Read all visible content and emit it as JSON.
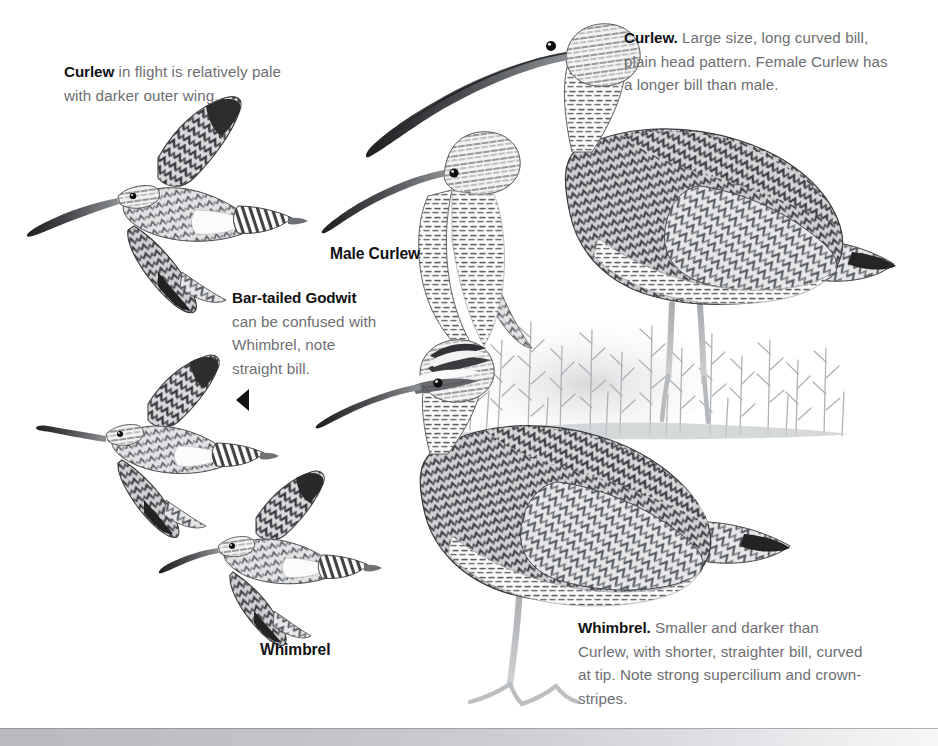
{
  "page": {
    "kind": "field-guide-plate",
    "background_color": "#ffffff",
    "width": 938,
    "height": 746,
    "medium": "graphite pencil illustration",
    "palette": {
      "body_text": "#6e6e72",
      "heading_text": "#111114",
      "artwork_ink": "#3a3a3d",
      "artwork_light": "#b6b8bb",
      "vegetation": "#b9bcbf",
      "footer_bar": "#c3c5c8"
    }
  },
  "callouts": {
    "curlew_flight": {
      "lead": "Curlew",
      "body": " in flight is relatively pale with darker outer wing."
    },
    "curlew_main": {
      "lead": "Curlew.",
      "body": " Large size, long curved bill, plain head pattern. Female Curlew has a longer bill than male."
    },
    "godwit": {
      "lead": "Bar-tailed Godwit",
      "body": " can be confused with Whimbrel, note straight bill."
    },
    "whimbrel_main": {
      "lead": "Whimbrel.",
      "body": " Smaller and darker than Curlew, with shorter, straighter bill, curved at tip. Note strong supercilium and crown-stripes."
    }
  },
  "labels": {
    "male_curlew": "Male Curlew",
    "whimbrel": "Whimbrel"
  },
  "figures": [
    {
      "name": "curlew-in-flight",
      "species": "Curlew",
      "pose": "flight",
      "position": "upper-left"
    },
    {
      "name": "bar-tailed-godwit-in-flight",
      "species": "Bar-tailed Godwit",
      "pose": "flight",
      "position": "mid-left"
    },
    {
      "name": "whimbrel-in-flight",
      "species": "Whimbrel",
      "pose": "flight",
      "position": "lower-left"
    },
    {
      "name": "curlew-standing",
      "species": "Curlew",
      "pose": "standing",
      "position": "upper-right"
    },
    {
      "name": "male-curlew-head",
      "species": "Curlew",
      "pose": "head-and-neck",
      "position": "center"
    },
    {
      "name": "whimbrel-standing",
      "species": "Whimbrel",
      "pose": "standing",
      "position": "lower-right"
    },
    {
      "name": "heather-vegetation",
      "species": "heather",
      "pose": "habitat",
      "position": "center-right"
    }
  ],
  "pointer": {
    "direction": "left",
    "target": "bar-tailed-godwit-in-flight"
  },
  "footer": {
    "text": ""
  }
}
